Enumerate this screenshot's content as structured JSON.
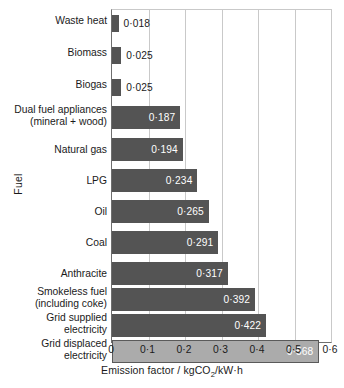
{
  "chart_data": {
    "type": "bar",
    "orientation": "horizontal",
    "title": "",
    "xlabel": "Emission factor / kgCO2/kW·h",
    "xlabel_parts": {
      "before": "Emission factor / kgCO",
      "sub": "2",
      "after": "/kW·h"
    },
    "ylabel": "Fuel",
    "xlim": [
      0,
      0.6
    ],
    "xticks": [
      0,
      0.1,
      0.2,
      0.3,
      0.4,
      0.5,
      0.6
    ],
    "xtick_labels": [
      "0",
      "0·1",
      "0·2",
      "0·3",
      "0·4",
      "0·5",
      "0·6"
    ],
    "grid": true,
    "grid_axis": "x",
    "legend": false,
    "categories": [
      "Waste heat",
      "Biomass",
      "Biogas",
      "Dual fuel appliances\n(mineral + wood)",
      "Natural gas",
      "LPG",
      "Oil",
      "Coal",
      "Anthracite",
      "Smokeless fuel\n(including coke)",
      "Grid supplied\nelectricity",
      "Grid displaced\nelectricity"
    ],
    "values": [
      0.018,
      0.025,
      0.025,
      0.187,
      0.194,
      0.234,
      0.265,
      0.291,
      0.317,
      0.392,
      0.422,
      0.568
    ],
    "value_labels": [
      "0·018",
      "0·025",
      "0·025",
      "0·187",
      "0·194",
      "0·234",
      "0·265",
      "0·291",
      "0·317",
      "0·392",
      "0·422",
      "0·568"
    ],
    "label_position": [
      "outside",
      "outside",
      "outside",
      "inside",
      "inside",
      "inside",
      "inside",
      "inside",
      "inside",
      "inside",
      "inside",
      "inside"
    ],
    "bar_colors": [
      "#545454",
      "#545454",
      "#545454",
      "#545454",
      "#545454",
      "#545454",
      "#545454",
      "#545454",
      "#545454",
      "#545454",
      "#545454",
      "#ababab"
    ],
    "highlight_index": 11,
    "colors": {
      "bar_dark": "#545454",
      "bar_light": "#ababab",
      "grid": "#c9c9c9",
      "axis": "#6e6e6e",
      "text": "#1a1a1a",
      "value_text_inside": "#ffffff",
      "value_text_outside": "#1a1a1a",
      "background": "#ffffff"
    },
    "layout": {
      "rows": [
        {
          "top": 5,
          "height": 17,
          "label_top": 6
        },
        {
          "top": 37,
          "height": 17,
          "label_top": 38
        },
        {
          "top": 69,
          "height": 17,
          "label_top": 70
        },
        {
          "top": 96,
          "height": 23,
          "label_top": 95
        },
        {
          "top": 128,
          "height": 23,
          "label_top": 135
        },
        {
          "top": 159,
          "height": 23,
          "label_top": 166
        },
        {
          "top": 190,
          "height": 23,
          "label_top": 197
        },
        {
          "top": 221,
          "height": 23,
          "label_top": 228
        },
        {
          "top": 252,
          "height": 23,
          "label_top": 259
        },
        {
          "top": 278,
          "height": 23,
          "label_top": 277
        },
        {
          "top": 304,
          "height": 23,
          "label_top": 303
        },
        {
          "top": 330,
          "height": 23,
          "label_top": 329
        }
      ]
    }
  }
}
